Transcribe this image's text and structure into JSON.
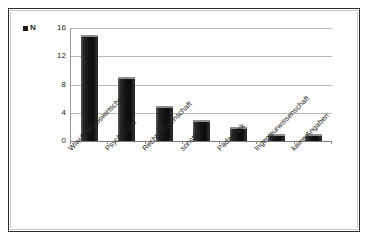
{
  "chart_data": {
    "type": "bar",
    "title": "",
    "subtitle": "",
    "xlabel": "",
    "ylabel": "",
    "categories": [
      "Wiwi/Betriebswirtschaft",
      "Psychologie",
      "Rechtswissenschaft",
      "sonstige",
      "Pädagogik",
      "Ingenieurwissenschaft",
      "keine Angaben"
    ],
    "values": [
      15,
      9,
      5,
      3,
      2,
      1,
      1
    ],
    "series": [
      {
        "name": "N",
        "values": [
          15,
          9,
          5,
          3,
          2,
          1,
          1
        ]
      }
    ],
    "ylim": [
      0,
      16
    ],
    "yticks": [
      0,
      4,
      8,
      12,
      16
    ],
    "ytick_labels": [
      "0",
      "4",
      "8",
      "12",
      "16"
    ],
    "grid": true,
    "grid_axis": "y",
    "legend": [
      "N"
    ],
    "legend_position": "top-left",
    "bar_color": "#151515",
    "gridline_color": "#b9b9b9",
    "axis_color": "#7d7d7d",
    "background_color": "#ffffff",
    "frame_color": "#2b2b2b",
    "xtick_label_rotation": -45
  },
  "legend": {
    "marker_name": "series-marker",
    "label": "N"
  },
  "axes": {
    "y": {
      "ticks": [
        "16",
        "12",
        "8",
        "4",
        "0"
      ]
    }
  }
}
